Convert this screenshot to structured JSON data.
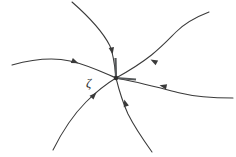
{
  "figure": {
    "background_color": "#ffffff",
    "curve_color": "#3a3a3a",
    "label_color": "#2e2e2e",
    "width": 236,
    "height": 157
  },
  "chart_data": {
    "type": "scatter",
    "xlabel": "",
    "ylabel": "",
    "xlim": [
      0,
      236
    ],
    "ylim": [
      0,
      157
    ],
    "grid": false,
    "legend": null,
    "equilibrium_point": {
      "label": "ζ",
      "label_name": "zeta",
      "x": 116,
      "y": 78,
      "label_x": 86,
      "label_y": 87,
      "stability": "attracting",
      "marker": "dot"
    },
    "series": [
      {
        "name": "trajectory-upper-left",
        "direction": "inward",
        "path": "M 12 65 C 34 59, 52 57, 70 61 C 88 65, 102 72, 116 78",
        "arrow": {
          "x": 78.5,
          "y": 63.2,
          "angle": 22
        }
      },
      {
        "name": "trajectory-top",
        "direction": "inward",
        "path": "M 72 2 C 88 16, 102 30, 110 46 C 114 56, 115 68, 116 78",
        "arrow": {
          "x": 112.6,
          "y": 54.5,
          "angle": 80
        }
      },
      {
        "name": "trajectory-upper-right",
        "direction": "inward",
        "path": "M 209 12 C 196 17, 186 22, 176 32 C 162 46, 152 58, 116 78",
        "arrow": {
          "x": 150.5,
          "y": 59.5,
          "angle": 208
        }
      },
      {
        "name": "trajectory-right",
        "direction": "inward",
        "path": "M 233 98 C 212 98, 196 97, 180 93 C 160 88, 138 82, 116 78",
        "arrow": {
          "x": 159.5,
          "y": 85.2,
          "angle": 193
        }
      },
      {
        "name": "trajectory-lower-left",
        "direction": "inward",
        "path": "M 53 150 C 62 132, 72 116, 86 102 C 96 92, 106 84, 116 78",
        "arrow": {
          "x": 96.5,
          "y": 92.5,
          "angle": 314
        }
      },
      {
        "name": "trajectory-bottom",
        "direction": "inward",
        "path": "M 152 152 C 142 138, 134 126, 128 114 C 123 103, 119 90, 116 78",
        "arrow": {
          "x": 124.2,
          "y": 99.5,
          "angle": 253
        }
      }
    ],
    "node_stubs": [
      {
        "name": "stub-up",
        "x1": 115.5,
        "y1": 58,
        "x2": 116,
        "y2": 78
      },
      {
        "name": "stub-right",
        "x1": 116,
        "y1": 78,
        "x2": 136,
        "y2": 79.5
      }
    ],
    "annotations": [
      {
        "text": "ζ",
        "x": 86,
        "y": 87
      }
    ]
  }
}
